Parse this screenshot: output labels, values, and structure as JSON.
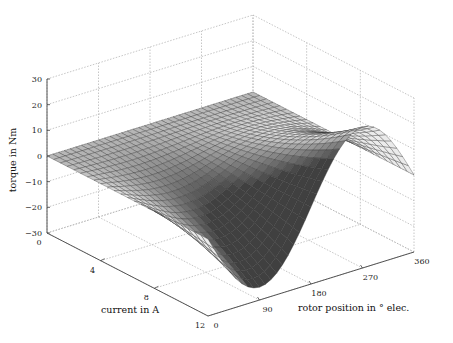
{
  "chart_data": {
    "type": "surface",
    "title": "",
    "xlabel": "rotor position in ° elec.",
    "ylabel": "current in A",
    "zlabel": "torque in Nm",
    "x_ticks": [
      0,
      90,
      180,
      270,
      360
    ],
    "y_ticks": [
      0,
      4,
      8,
      12
    ],
    "z_ticks": [
      -30,
      -20,
      -10,
      0,
      10,
      20,
      30
    ],
    "xlim": [
      0,
      360
    ],
    "ylim": [
      0,
      12
    ],
    "zlim": [
      -30,
      30
    ],
    "grid": true,
    "legend": null,
    "colormap": "gray",
    "mesh": {
      "x_steps": 36,
      "y_steps": 24
    },
    "model": "torque = -amplitude * (current/12)^2 * sin(rotor_position)",
    "amplitude_at_12A": 25,
    "samples": {
      "current_A": [
        0,
        4,
        8,
        12
      ],
      "rotor_position_deg": [
        0,
        90,
        180,
        270,
        360
      ],
      "torque_Nm": [
        [
          0,
          0,
          0,
          0,
          0
        ],
        [
          0,
          -2.8,
          0,
          2.8,
          0
        ],
        [
          0,
          -11.1,
          0,
          11.1,
          0
        ],
        [
          0,
          -25,
          0,
          25,
          0
        ]
      ]
    }
  },
  "axes_labels": {
    "x": "rotor position in ° elec.",
    "y": "current in A",
    "z": "torque in Nm"
  },
  "tick_labels": {
    "x": [
      "0",
      "90",
      "180",
      "270",
      "360"
    ],
    "y": [
      "0",
      "4",
      "8",
      "12"
    ],
    "z": [
      "−30",
      "−20",
      "−10",
      "0",
      "10",
      "20",
      "30"
    ]
  },
  "colors": {
    "grid": "#b8b8b8",
    "axis": "#444444",
    "mesh_line": "#333333"
  }
}
